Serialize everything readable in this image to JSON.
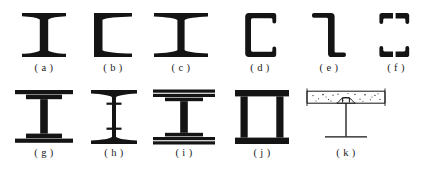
{
  "figure": {
    "ink_color": "#141414",
    "background_color": "#ffffff",
    "rows": 2,
    "columns_row1": 6,
    "columns_row2": 5
  },
  "items": [
    {
      "key": "a",
      "caption": "( a )",
      "name": "rolled-i-beam-tapered-flange",
      "description": "Rolled I-beam with narrow tapered flanges",
      "row": 1,
      "x": 14,
      "y": 10,
      "w": 60,
      "h": 50,
      "caption_y": 62
    },
    {
      "key": "b",
      "caption": "( b )",
      "name": "channel-tapered-flange",
      "description": "Rolled channel section with tapered flanges",
      "row": 1,
      "x": 88,
      "y": 10,
      "w": 50,
      "h": 50,
      "caption_y": 62
    },
    {
      "key": "c",
      "caption": "( c )",
      "name": "wide-flange-i-beam",
      "description": "Wide flange I-beam with tapered flanges",
      "row": 1,
      "x": 150,
      "y": 10,
      "w": 62,
      "h": 50,
      "caption_y": 62
    },
    {
      "key": "d",
      "caption": "( d )",
      "name": "c-channel-parallel-flange",
      "description": "Cold-formed C channel with parallel flanges and lips",
      "row": 1,
      "x": 238,
      "y": 10,
      "w": 44,
      "h": 50,
      "caption_y": 62
    },
    {
      "key": "e",
      "caption": "( e )",
      "name": "z-section-purlin",
      "description": "Cold-formed Z purlin section",
      "row": 1,
      "x": 305,
      "y": 10,
      "w": 48,
      "h": 50,
      "caption_y": 62
    },
    {
      "key": "f",
      "caption": "( f )",
      "name": "double-channel-back-to-back",
      "description": "Two channels placed back to back",
      "row": 1,
      "x": 372,
      "y": 10,
      "w": 48,
      "h": 50,
      "caption_y": 62
    },
    {
      "key": "g",
      "caption": "( g )",
      "name": "i-beam-with-cover-plates",
      "description": "I-beam reinforced with single cover plates top and bottom",
      "row": 2,
      "x": 14,
      "y": 88,
      "w": 60,
      "h": 58,
      "caption_y": 149
    },
    {
      "key": "h",
      "caption": "( h )",
      "name": "riveted-i-beam-with-stiffeners",
      "description": "I-beam with riveted web stiffeners",
      "row": 2,
      "x": 86,
      "y": 88,
      "w": 56,
      "h": 58,
      "caption_y": 149
    },
    {
      "key": "i",
      "caption": "( i )",
      "name": "i-beam-with-double-cover-plates",
      "description": "I-beam reinforced with double cover plates top and bottom",
      "row": 2,
      "x": 152,
      "y": 88,
      "w": 64,
      "h": 58,
      "caption_y": 149
    },
    {
      "key": "j",
      "caption": "( j )",
      "name": "built-up-box-section",
      "description": "Built-up box girder with two webs and flange plates",
      "row": 2,
      "x": 232,
      "y": 88,
      "w": 60,
      "h": 58,
      "caption_y": 149
    },
    {
      "key": "k",
      "caption": "( k )",
      "name": "composite-beam-with-concrete-slab",
      "description": "Steel beam acting compositely with concrete slab via shear stud",
      "row": 2,
      "x": 302,
      "y": 88,
      "w": 88,
      "h": 58,
      "caption_y": 149
    }
  ]
}
